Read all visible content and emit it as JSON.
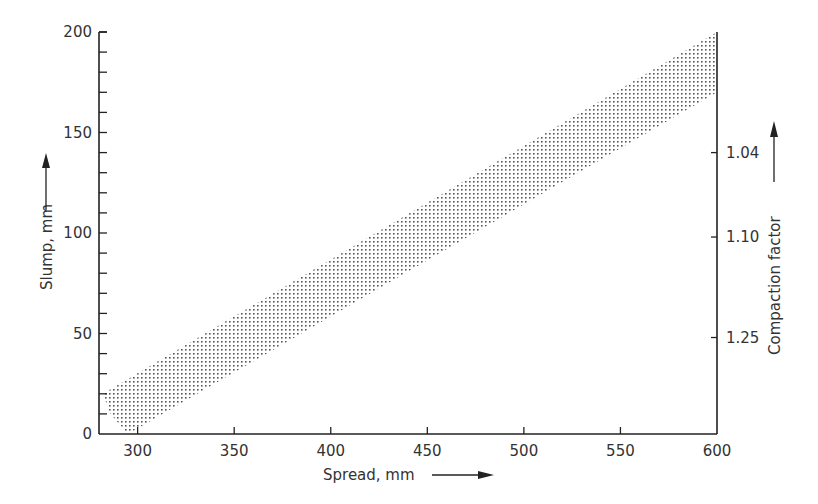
{
  "chart_data": {
    "type": "area",
    "title": "",
    "xlabel": "Spread, mm",
    "ylabel": "Slump, mm",
    "y2label": "Compaction factor",
    "xlim": [
      280,
      600
    ],
    "ylim": [
      0,
      200
    ],
    "x_ticks": [
      300,
      350,
      400,
      450,
      500,
      550,
      600
    ],
    "y_ticks": [
      0,
      50,
      100,
      150,
      200
    ],
    "y_minor_step": 10,
    "y2_ticks": [
      {
        "label": "1.04",
        "slump": 140
      },
      {
        "label": "1.10",
        "slump": 98
      },
      {
        "label": "1.25",
        "slump": 48
      }
    ],
    "grid": false,
    "legend": null,
    "series": [
      {
        "name": "Slump–spread relationship band",
        "upper": {
          "x": [
            282,
            600
          ],
          "y": [
            20,
            200
          ]
        },
        "lower": {
          "x": [
            295,
            600
          ],
          "y": [
            0,
            170
          ]
        },
        "left_edge": {
          "x": [
            282,
            286,
            295
          ],
          "y": [
            20,
            10,
            0
          ]
        },
        "fill": "stippled",
        "color": "#555555"
      }
    ]
  },
  "labels": {
    "xlabel": "Spread, mm",
    "ylabel": "Slump, mm",
    "y2label": "Compaction factor",
    "x_ticks": [
      "300",
      "350",
      "400",
      "450",
      "500",
      "550",
      "600"
    ],
    "y_ticks": [
      "0",
      "50",
      "100",
      "150",
      "200"
    ],
    "y2_ticks": [
      "1.04",
      "1.10",
      "1.25"
    ]
  }
}
